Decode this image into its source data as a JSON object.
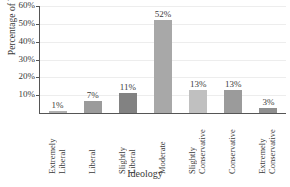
{
  "chart_data": {
    "type": "bar",
    "title": "",
    "xlabel": "Ideology",
    "ylabel": "Percentage of Voters",
    "categories": [
      "Extremely Liberal",
      "Liberal",
      "Slightly Liberal",
      "Moderate",
      "Slightly Conservative",
      "Conservative",
      "Extremely Conservative"
    ],
    "category_lines": [
      [
        "Extremely",
        "Liberal"
      ],
      [
        "Liberal"
      ],
      [
        "Slightly",
        "Liberal"
      ],
      [
        "Moderate"
      ],
      [
        "Slightly",
        "Conservative"
      ],
      [
        "Conservative"
      ],
      [
        "Extremely",
        "Conservative"
      ]
    ],
    "values": [
      1,
      7,
      11,
      52,
      13,
      13,
      3
    ],
    "value_labels": [
      "1%",
      "7%",
      "11%",
      "52%",
      "13%",
      "13%",
      "3%"
    ],
    "bar_colors": [
      "#b0b0b0",
      "#9b9b9b",
      "#828282",
      "#a8a8a8",
      "#c0c0c0",
      "#9b9b9b",
      "#8f8f8f"
    ],
    "ylim": [
      0,
      60
    ],
    "yticks": [
      10,
      20,
      30,
      40,
      50,
      60
    ],
    "ytick_labels": [
      "10%",
      "20%",
      "30%",
      "40%",
      "50%",
      "60%"
    ],
    "grid": true,
    "legend": false,
    "axis_color": "#555555",
    "grid_color": "#ededed",
    "text_color": "#3a3a3a",
    "background": "#ffffff"
  }
}
